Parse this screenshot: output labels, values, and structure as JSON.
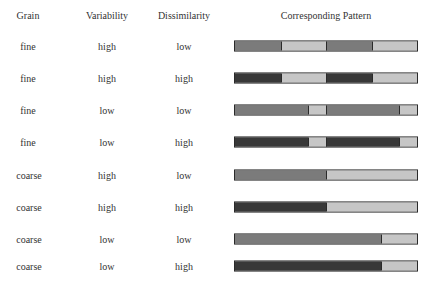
{
  "headers": {
    "grain": "Grain",
    "variability": "Variability",
    "dissimilarity": "Dissimilarity",
    "pattern": "Corresponding Pattern"
  },
  "colors": {
    "medium": "#7b7b7b",
    "dark": "#383838",
    "light": "#c6c6c6",
    "border": "#2a2a2a"
  },
  "rows": [
    {
      "grain": "fine",
      "variability": "high",
      "dissimilarity": "low",
      "pattern": [
        [
          "medium",
          25
        ],
        [
          "light",
          25
        ],
        [
          "medium",
          25
        ],
        [
          "light",
          25
        ]
      ]
    },
    {
      "grain": "fine",
      "variability": "high",
      "dissimilarity": "high",
      "pattern": [
        [
          "dark",
          25
        ],
        [
          "light",
          25
        ],
        [
          "dark",
          25
        ],
        [
          "light",
          25
        ]
      ]
    },
    {
      "grain": "fine",
      "variability": "low",
      "dissimilarity": "low",
      "pattern": [
        [
          "medium",
          40
        ],
        [
          "light",
          10
        ],
        [
          "medium",
          40
        ],
        [
          "light",
          10
        ]
      ]
    },
    {
      "grain": "fine",
      "variability": "low",
      "dissimilarity": "high",
      "pattern": [
        [
          "dark",
          40
        ],
        [
          "light",
          10
        ],
        [
          "dark",
          40
        ],
        [
          "light",
          10
        ]
      ]
    },
    {
      "grain": "coarse",
      "variability": "high",
      "dissimilarity": "low",
      "pattern": [
        [
          "medium",
          50
        ],
        [
          "light",
          50
        ]
      ]
    },
    {
      "grain": "coarse",
      "variability": "high",
      "dissimilarity": "high",
      "pattern": [
        [
          "dark",
          50
        ],
        [
          "light",
          50
        ]
      ]
    },
    {
      "grain": "coarse",
      "variability": "low",
      "dissimilarity": "low",
      "pattern": [
        [
          "medium",
          80
        ],
        [
          "light",
          20
        ]
      ]
    },
    {
      "grain": "coarse",
      "variability": "low",
      "dissimilarity": "high",
      "pattern": [
        [
          "dark",
          80
        ],
        [
          "light",
          20
        ]
      ]
    }
  ]
}
